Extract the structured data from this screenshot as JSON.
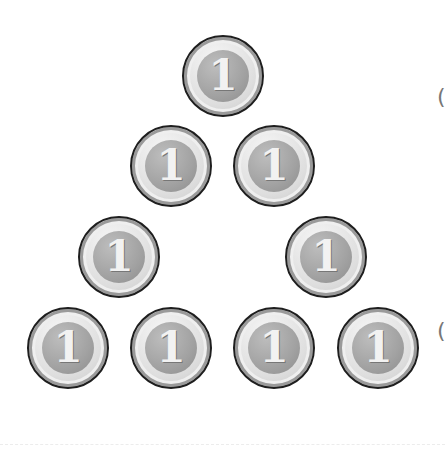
{
  "figure": {
    "coin_label": "1",
    "coin_count": 8,
    "coins": [
      {
        "row": 1,
        "x": 223,
        "y": 76
      },
      {
        "row": 2,
        "x": 171,
        "y": 166
      },
      {
        "row": 2,
        "x": 274,
        "y": 166
      },
      {
        "row": 3,
        "x": 119,
        "y": 257
      },
      {
        "row": 3,
        "x": 326,
        "y": 257
      },
      {
        "row": 4,
        "x": 68,
        "y": 348
      },
      {
        "row": 4,
        "x": 171,
        "y": 348
      },
      {
        "row": 4,
        "x": 274,
        "y": 348
      },
      {
        "row": 4,
        "x": 378,
        "y": 348
      }
    ],
    "bracket_top": "(",
    "bracket_bottom": "("
  }
}
